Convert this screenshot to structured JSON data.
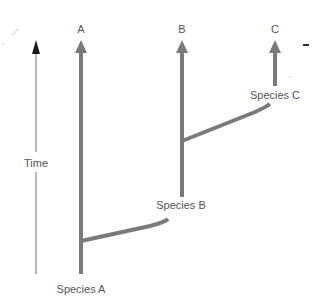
{
  "diagram": {
    "type": "phylogenetic-tree",
    "axis": {
      "label": "Time"
    },
    "tips": [
      {
        "id": "A",
        "label": "A"
      },
      {
        "id": "B",
        "label": "B"
      },
      {
        "id": "C",
        "label": "C"
      }
    ],
    "nodes": [
      {
        "id": "species-a",
        "label": "Species A"
      },
      {
        "id": "species-b",
        "label": "Species B"
      },
      {
        "id": "species-c",
        "label": "Species C"
      }
    ],
    "colors": {
      "branch": "#7a7a7a",
      "axis": "#888888",
      "axis_arrow": "#1a1a1a",
      "text": "#555555"
    }
  }
}
